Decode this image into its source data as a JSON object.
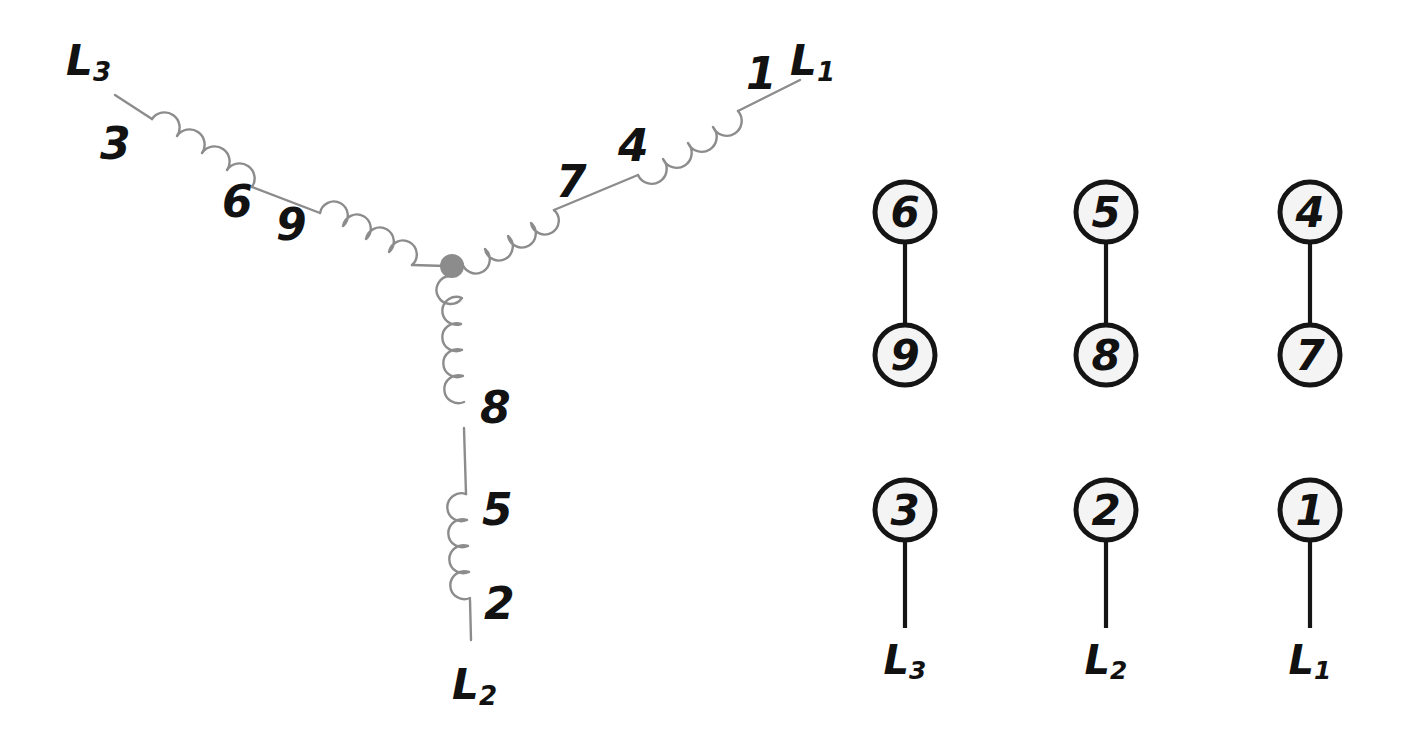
{
  "diagram": {
    "background_color": "#ffffff",
    "coil_stroke_color": "#8c8c8c",
    "label_color": "#121212",
    "terminal_fill_color": "#f4f4f4",
    "terminal_stroke_color": "#151515",
    "center_node_color": "#8c8c8c"
  },
  "wye": {
    "center_node_name": "neutral-junction",
    "branches": [
      {
        "phase": "L3",
        "phase_label_main": "L",
        "phase_label_sub": "3",
        "direction": "upper-left",
        "coil_numbers": [
          "9",
          "6",
          "3"
        ]
      },
      {
        "phase": "L1",
        "phase_label_main": "L",
        "phase_label_sub": "1",
        "direction": "upper-right",
        "coil_numbers": [
          "7",
          "4",
          "1"
        ]
      },
      {
        "phase": "L2",
        "phase_label_main": "L",
        "phase_label_sub": "2",
        "direction": "down",
        "coil_numbers": [
          "8",
          "5",
          "2"
        ]
      }
    ],
    "labels": {
      "n3": "3",
      "n6": "6",
      "n9": "9",
      "n7": "7",
      "n4": "4",
      "n1": "1",
      "n8": "8",
      "n5": "5",
      "n2": "2",
      "L3_main": "L",
      "L3_sub": "3",
      "L1_main": "L",
      "L1_sub": "1",
      "L2_main": "L",
      "L2_sub": "2"
    }
  },
  "terminal_board": {
    "paired_row": [
      {
        "top": "6",
        "bottom": "9"
      },
      {
        "top": "5",
        "bottom": "8"
      },
      {
        "top": "4",
        "bottom": "7"
      }
    ],
    "line_row": [
      {
        "terminal": "3",
        "phase_main": "L",
        "phase_sub": "3"
      },
      {
        "terminal": "2",
        "phase_main": "L",
        "phase_sub": "2"
      },
      {
        "terminal": "1",
        "phase_main": "L",
        "phase_sub": "1"
      }
    ]
  }
}
